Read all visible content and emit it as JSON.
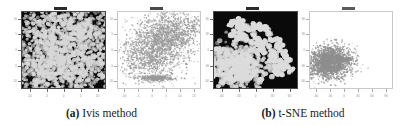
{
  "figure": {
    "caption_a_label": "(a)",
    "caption_a_text": "Ivis method",
    "caption_b_label": "(b)",
    "caption_b_text": "t-SNE method",
    "background_color": "#ffffff"
  },
  "panels": [
    {
      "name": "ivis-dark-embedding",
      "style": "dark",
      "left": 12,
      "width": 97,
      "title_color": "#2b2b2b",
      "point_color": "#d8d8d8",
      "bg_color": "#0a0a0a",
      "tick_color": "#707070",
      "x_ticks": [
        "-10",
        "-5",
        "0",
        "5",
        "10"
      ],
      "y_ticks": [
        "10",
        "5",
        "0",
        "-5",
        "-10"
      ]
    },
    {
      "name": "ivis-light-embedding",
      "style": "light",
      "left": 108,
      "width": 96,
      "title_color": "#4a4a4a",
      "point_color": "#9a9a9a",
      "bg_color": "#ffffff",
      "tick_color": "#aaaaaa",
      "x_ticks": [
        "-10",
        "-5",
        "0",
        "5",
        "10",
        "15"
      ],
      "y_ticks": [
        "10",
        "5",
        "0",
        "-5",
        "-10"
      ]
    },
    {
      "name": "tsne-dark-embedding",
      "style": "dark",
      "left": 204,
      "width": 97,
      "title_color": "#2b2b2b",
      "point_color": "#dcdcdc",
      "bg_color": "#0a0a0a",
      "tick_color": "#707070",
      "x_ticks": [
        "-60",
        "-30",
        "0",
        "30",
        "60"
      ],
      "y_ticks": [
        "60",
        "30",
        "0",
        "-30",
        "-60"
      ]
    },
    {
      "name": "tsne-light-embedding",
      "style": "light",
      "left": 300,
      "width": 96,
      "title_color": "#5a5a5a",
      "point_color": "#8f8f8f",
      "bg_color": "#ffffff",
      "tick_color": "#aaaaaa",
      "x_ticks": [
        "-60",
        "-30",
        "0",
        "30",
        "60",
        "90"
      ],
      "y_ticks": [
        "60",
        "30",
        "0",
        "-30",
        "-60"
      ]
    }
  ],
  "chart_data": [
    {
      "type": "scatter",
      "panel": "ivis-dark-embedding",
      "title": "",
      "xlabel": "",
      "ylabel": "",
      "xlim": [
        -12,
        12
      ],
      "ylim": [
        -12,
        12
      ],
      "grid": false,
      "legend": "none",
      "marker_size": 2.1,
      "n_points": 2400,
      "description": "Single large dense roughly circular cloud of light markers filling most of the dark panel, slightly offset to upper-right, with a concave notch on the lower-left edge.",
      "clusters": [
        {
          "name": "main-blob",
          "cx": 0.52,
          "cy": 0.5,
          "rx": 0.4,
          "ry": 0.43,
          "weight": 0.78,
          "spread": 0.93
        },
        {
          "name": "upper-arc",
          "cx": 0.6,
          "cy": 0.26,
          "rx": 0.32,
          "ry": 0.18,
          "weight": 0.12,
          "spread": 0.9
        },
        {
          "name": "lower-tail",
          "cx": 0.38,
          "cy": 0.78,
          "rx": 0.24,
          "ry": 0.14,
          "weight": 0.1,
          "spread": 0.9
        }
      ]
    },
    {
      "type": "scatter",
      "panel": "ivis-light-embedding",
      "title": "",
      "xlabel": "",
      "ylabel": "",
      "xlim": [
        -12,
        16
      ],
      "ylim": [
        -12,
        12
      ],
      "grid": false,
      "legend": "none",
      "marker_size": 0.9,
      "n_points": 3000,
      "description": "Elongated diagonal gray cloud running from lower-left to upper-right, densest in the centre, plus a thin separate horizontal streak near the bottom-centre.",
      "clusters": [
        {
          "name": "diagonal-core",
          "cx": 0.52,
          "cy": 0.42,
          "rx": 0.21,
          "ry": 0.2,
          "weight": 0.46,
          "spread": 1.0,
          "rot": -0.62
        },
        {
          "name": "upper-right-lobe",
          "cx": 0.67,
          "cy": 0.27,
          "rx": 0.2,
          "ry": 0.11,
          "weight": 0.26,
          "spread": 1.0,
          "rot": -0.35
        },
        {
          "name": "lower-left-tail",
          "cx": 0.32,
          "cy": 0.62,
          "rx": 0.14,
          "ry": 0.15,
          "weight": 0.15,
          "spread": 1.0,
          "rot": -0.6
        },
        {
          "name": "bottom-streak",
          "cx": 0.47,
          "cy": 0.87,
          "rx": 0.13,
          "ry": 0.022,
          "weight": 0.13,
          "spread": 0.85,
          "rot": 0.0
        }
      ]
    },
    {
      "type": "scatter",
      "panel": "tsne-dark-embedding",
      "title": "",
      "xlabel": "",
      "ylabel": "",
      "xlim": [
        -75,
        75
      ],
      "ylim": [
        -75,
        75
      ],
      "grid": false,
      "legend": "none",
      "marker_size": 2.6,
      "n_points": 1450,
      "description": "One dense oval blob in the lower-left quadrant, plus a wide crescent arc of many small discrete square-ish micro-clusters sweeping from the top-centre around to the lower-right.",
      "clusters": [
        {
          "name": "dense-blob",
          "cx": 0.27,
          "cy": 0.7,
          "rx": 0.19,
          "ry": 0.155,
          "weight": 0.46,
          "spread": 0.95
        }
      ],
      "arc": {
        "name": "crescent-microclusters",
        "cx": 0.17,
        "cy": 0.86,
        "r_inner": 0.52,
        "r_outer": 0.8,
        "angle_start": -88,
        "angle_end": -4,
        "n_clusters": 110,
        "cluster_radius": 0.018,
        "points_per_cluster": 9
      }
    },
    {
      "type": "scatter",
      "panel": "tsne-light-embedding",
      "title": "",
      "xlabel": "",
      "ylabel": "",
      "xlim": [
        -75,
        105
      ],
      "ylim": [
        -75,
        75
      ],
      "grid": false,
      "legend": "none",
      "marker_size": 1.0,
      "n_points": 2300,
      "description": "A single compact dense gray oval blob positioned in the lower-left region of the otherwise empty white panel, with a faint whisker extending to its right.",
      "clusters": [
        {
          "name": "dense-oval",
          "cx": 0.24,
          "cy": 0.66,
          "rx": 0.135,
          "ry": 0.105,
          "weight": 0.94,
          "spread": 0.95
        },
        {
          "name": "right-whisker",
          "cx": 0.4,
          "cy": 0.62,
          "rx": 0.05,
          "ry": 0.015,
          "weight": 0.06,
          "spread": 0.9
        }
      ]
    }
  ]
}
